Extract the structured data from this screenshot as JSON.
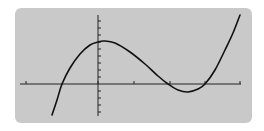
{
  "chart_data": {
    "type": "line",
    "title": "",
    "xlabel": "",
    "ylabel": "",
    "axes": {
      "x_axis_y_px": 84,
      "y_axis_x_px": 98,
      "x_range_px": [
        20,
        241
      ],
      "y_range_px": [
        15,
        116
      ],
      "x_ticks_px": [
        26,
        98,
        134,
        170,
        205,
        240
      ],
      "y_tick_spacing_px": 7
    },
    "series": [
      {
        "name": "f(x)",
        "color": "#111111",
        "points_px": [
          [
            52,
            115
          ],
          [
            57,
            100
          ],
          [
            62,
            84
          ],
          [
            70,
            68
          ],
          [
            80,
            54
          ],
          [
            90,
            45
          ],
          [
            98,
            42
          ],
          [
            104,
            41
          ],
          [
            115,
            43
          ],
          [
            130,
            52
          ],
          [
            145,
            64
          ],
          [
            158,
            76
          ],
          [
            168,
            84
          ],
          [
            178,
            90
          ],
          [
            188,
            92
          ],
          [
            198,
            89
          ],
          [
            205,
            84
          ],
          [
            215,
            70
          ],
          [
            225,
            50
          ],
          [
            233,
            33
          ],
          [
            240,
            15
          ]
        ]
      }
    ],
    "roots_px_x": [
      62,
      168,
      205
    ],
    "local_max_px": [
      104,
      41
    ],
    "local_min_px": [
      188,
      92
    ],
    "grid": false,
    "legend": null
  },
  "colors": {
    "panel_bg": "#c9c9c9",
    "axis": "#222222",
    "curve": "#111111",
    "page_bg": "#ffffff"
  }
}
